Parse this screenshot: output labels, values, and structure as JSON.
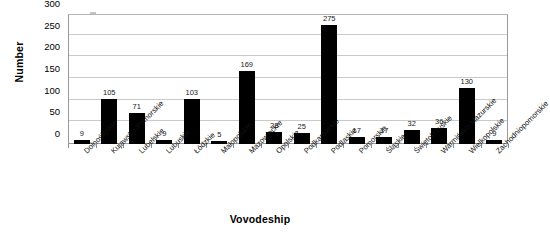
{
  "chart_data": {
    "type": "bar",
    "title": "",
    "xlabel": "Vovodeship",
    "ylabel": "Number",
    "ylim": [
      0,
      300
    ],
    "yticks": [
      0,
      50,
      100,
      150,
      200,
      250,
      300
    ],
    "grid": true,
    "legend": "none",
    "bar_color": "#000000",
    "show_data_labels": true,
    "categories": [
      "Dolnośląskie",
      "Kujawsko-Pomorskie",
      "Lubelskie",
      "Lubuskie",
      "Łódzkie",
      "Małopolskie",
      "Mazowieckie",
      "Opolskie",
      "Podkarpackie",
      "Podlaskie",
      "Pomorskie",
      "Śląskie",
      "Świętokrzyskie",
      "Warmińsko-Mazurskie",
      "Wielkopolskie",
      "Zachodniopomorskie"
    ],
    "values": [
      9,
      105,
      71,
      9,
      103,
      5,
      169,
      28,
      25,
      275,
      17,
      17,
      32,
      36,
      130,
      9
    ],
    "value_labels": [
      "9",
      "105",
      "71",
      "9",
      "103",
      "5",
      "169",
      "28",
      "25",
      "275",
      "17",
      "17",
      "32",
      "36",
      "130",
      "9"
    ],
    "ytick_labels": [
      "0",
      "50",
      "100",
      "150",
      "200",
      "250",
      "300"
    ]
  }
}
